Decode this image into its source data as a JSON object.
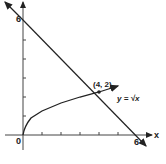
{
  "diagram": {
    "type": "graph",
    "x_axis_label": "x",
    "y_axis_label": "y",
    "origin_label": "0",
    "x_intercept_label": "6",
    "y_intercept_label": "6",
    "intersection_label": "(4, 2)",
    "curve_label": "y = √x",
    "x_ticks": [
      1,
      2,
      3,
      4,
      5,
      6
    ],
    "y_ticks": [
      1,
      2,
      3,
      4,
      5,
      6
    ],
    "line": {
      "from": [
        0,
        6
      ],
      "to": [
        6,
        0
      ],
      "equation": "y = 6 - x"
    },
    "curve": {
      "equation": "y = sqrt(x)",
      "domain": [
        0,
        5
      ]
    },
    "intersection": [
      4,
      2
    ],
    "colors": {
      "stroke": "#222222",
      "background": "#ffffff"
    }
  }
}
